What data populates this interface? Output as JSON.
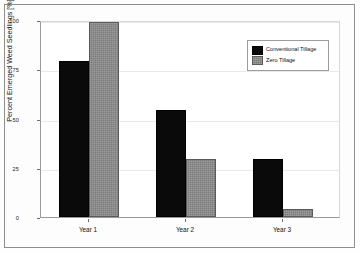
{
  "chart_data": {
    "type": "bar",
    "title": "",
    "subtitle": "",
    "xlabel": "",
    "ylabel": "Percent Emerged Weed Seedlings [%]",
    "categories": [
      "Year 1",
      "Year 2",
      "Year 3"
    ],
    "series": [
      {
        "name": "Conventional Tillage",
        "color": "#0a0a0a",
        "values": [
          80,
          55,
          30
        ]
      },
      {
        "name": "Zero Tillage",
        "color": "#7b7b7b",
        "values": [
          100,
          30,
          4
        ]
      }
    ],
    "ylim": [
      0,
      100
    ],
    "yticks": [
      0,
      25,
      50,
      75,
      100
    ],
    "ytick_labels": [
      "0",
      "25",
      "50",
      "75",
      "100"
    ],
    "grid": true,
    "legend_position": "top-right"
  },
  "legend": {
    "entries": [
      {
        "label": "Conventional Tillage",
        "swatch": "black-square-swatch"
      },
      {
        "label": "Zero Tillage",
        "swatch": "gray-textured-square-swatch"
      }
    ]
  }
}
